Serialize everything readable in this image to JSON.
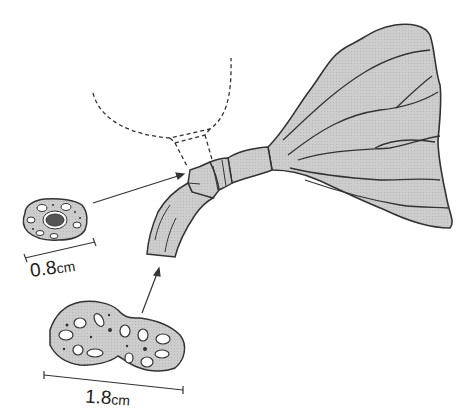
{
  "figure": {
    "type": "botanical illustration",
    "colors": {
      "fill": "#c9c9c9",
      "stroke": "#333333",
      "core": "#555555",
      "background": "#ffffff"
    }
  },
  "labels": {
    "small_section": {
      "value": "0.8",
      "unit": "cm"
    },
    "large_section": {
      "value": "1.8",
      "unit": "cm"
    }
  }
}
